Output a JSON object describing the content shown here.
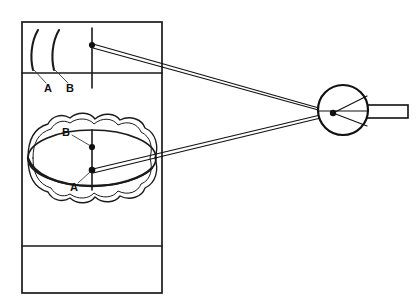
{
  "figure": {
    "background_color": "#ffffff",
    "line_color": "#1a1a1a",
    "width": 419,
    "height": 306
  },
  "labels": {
    "upper_a": "A",
    "upper_b": "B",
    "lower_b": "B",
    "lower_a": "A"
  },
  "chart_panel": {
    "name": "target-chart-panel",
    "left": 22,
    "right": 162,
    "top": 22,
    "bottom": 293,
    "divider_top_y": 73,
    "divider_bottom_y": 246
  },
  "arcs": {
    "arc_a": {
      "label": "A"
    },
    "arc_b": {
      "label": "B"
    }
  },
  "upper_target": {
    "name": "upper-target-point",
    "x": 92,
    "y": 45,
    "tick_top_y": 28,
    "tick_bottom_y": 88
  },
  "lower_targets": {
    "tick_x": 92,
    "tick_top_y": 130,
    "tick_bottom_y": 190,
    "point_b": {
      "x": 92,
      "y": 147
    },
    "point_a": {
      "x": 92,
      "y": 170
    }
  },
  "eye": {
    "name": "eye-globe",
    "center_x": 343,
    "center_y": 110,
    "radius": 25,
    "nodal_point": {
      "x": 333,
      "y": 113
    },
    "optic_nerve": {
      "x": 366,
      "y": 105,
      "width": 42,
      "height": 13
    }
  },
  "rays": {
    "upper_bundle_count": 2,
    "lower_bundle_count": 2,
    "converge_x": 333,
    "converge_y": 113
  }
}
